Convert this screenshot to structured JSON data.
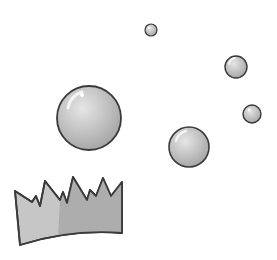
{
  "scene": {
    "background": "#ffffff",
    "outline_color": "#3a3a3a",
    "bubble_fill": "#c8c8c8",
    "crown_fill_light": "#c6c6c6",
    "crown_fill_dark": "#a9a9a9"
  },
  "bubbles": [
    {
      "name": "large-bubble",
      "cx": 89,
      "cy": 118,
      "r": 32
    },
    {
      "name": "medium-bubble",
      "cx": 189,
      "cy": 147,
      "r": 20
    },
    {
      "name": "small-bubble-right-upper",
      "cx": 236,
      "cy": 67,
      "r": 11
    },
    {
      "name": "small-bubble-right-lower",
      "cx": 252,
      "cy": 114,
      "r": 9
    },
    {
      "name": "tiny-bubble-top",
      "cx": 151,
      "cy": 30,
      "r": 6
    }
  ],
  "crown": {
    "label": "paper-crown"
  }
}
